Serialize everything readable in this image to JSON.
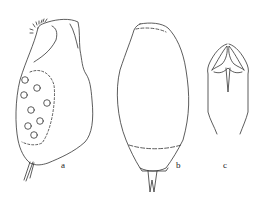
{
  "figure": {
    "panels": [
      {
        "id": "a",
        "label": "a",
        "description": "lateral view of organism with internal spheres"
      },
      {
        "id": "b",
        "label": "b",
        "description": "dorsal view of organism"
      },
      {
        "id": "c",
        "label": "c",
        "description": "trophi (jaw apparatus)"
      }
    ],
    "line_color": "#333333",
    "background": "#ffffff"
  }
}
